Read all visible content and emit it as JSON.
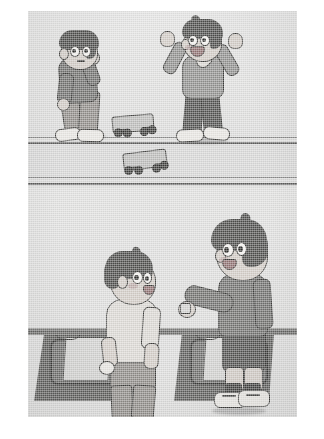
{
  "meta": {
    "kind": "scanned-illustration",
    "orientation": "portrait",
    "color_mode": "grayscale",
    "panel_count": 2
  },
  "palette": {
    "page_background": "#ffffff",
    "illustration_background": "#dcdcdb",
    "ink_outline": "#3a3a38",
    "hair_dark": "#4b4b49",
    "skin": "#cfc9c3",
    "shirt_dark_gray": "#6e6e6c",
    "shirt_mid_gray": "#8e8e8c",
    "shirt_light": "#d9d6d1",
    "pants_dark": "#4f4f4d",
    "shoe_white": "#e6e4e0",
    "shoe_dark": "#3f3f3d",
    "road_line": "#5d5d5c",
    "desk_dark": "#5b5b59",
    "paper_light": "#cfcfcd"
  },
  "illustration": {
    "frame": {
      "left": 28,
      "top": 11,
      "width": 269,
      "height": 406
    },
    "panels": [
      {
        "id": "panel-top",
        "name": "top-panel",
        "setting": "sidewalk-and-road",
        "description": "Two boys on a pavement beside a road with two loose skateboards on the ground.",
        "road": {
          "lines": [
            {
              "y": 126,
              "thickness": 1,
              "tone": "#8b8b8a"
            },
            {
              "y": 131,
              "thickness": 2,
              "tone": "#5d5d5c"
            },
            {
              "y": 166,
              "thickness": 1,
              "tone": "#8b8b8a"
            },
            {
              "y": 172,
              "thickness": 2,
              "tone": "#5d5d5c"
            }
          ]
        },
        "characters": [
          {
            "id": "boy-sad",
            "name": "bending-boy-left",
            "pose": "bent forward, hands on knees, downcast",
            "expression": "sad",
            "hair": "dark short",
            "top": "dark gray long-sleeve jacket",
            "bottom": "gray trousers",
            "shoes": "white sneakers"
          },
          {
            "id": "boy-cheering",
            "name": "cheering-boy-right",
            "pose": "both arms raised, mouth open, jumping",
            "expression": "happy / cheering",
            "hair": "dark short",
            "top": "mid gray sweater with collar",
            "bottom": "dark trousers",
            "shoes": "white sneakers"
          }
        ],
        "objects": [
          {
            "id": "skateboard-1",
            "name": "skateboard-on-pavement",
            "tone": "#b9b9b7",
            "wheels": 4
          },
          {
            "id": "skateboard-2",
            "name": "skateboard-on-road",
            "tone": "#b9b9b7",
            "wheels": 4
          }
        ]
      },
      {
        "id": "panel-bottom",
        "name": "bottom-panel",
        "setting": "indoor counter or desks",
        "description": "A shirtless-sleeved boy in a light tee faces a taller boy in a dark outfit who reaches across a counter holding something; two dark desks with light papers sit behind them.",
        "characters": [
          {
            "id": "boy-light-shirt",
            "name": "boy-in-light-shirt",
            "pose": "standing, back three-quarter view, looking up and right",
            "expression": "smiling",
            "hair": "dark bowl cut",
            "top": "light cream short-sleeve shirt",
            "bottom": "gray shorts",
            "shoes": "not visible"
          },
          {
            "id": "boy-dark-outfit",
            "name": "boy-in-dark-outfit",
            "pose": "standing, reaching left arm forward over the counter",
            "expression": "smiling",
            "hair": "dark spiky-top cut",
            "top": "dark gray long-sleeve shirt",
            "bottom": "dark shorts",
            "shoes": "white sneakers with dark socks"
          }
        ],
        "objects": [
          {
            "id": "counter-bar",
            "name": "counter-edge",
            "tone": "#5e5e5c"
          },
          {
            "id": "desk-left",
            "name": "desk-left",
            "tone": "#5b5b59"
          },
          {
            "id": "desk-right",
            "name": "desk-right",
            "tone": "#5b5b59"
          },
          {
            "id": "paper-left",
            "name": "paper-on-left-desk",
            "tone": "#cfcfcd"
          },
          {
            "id": "paper-right",
            "name": "paper-on-right-desk",
            "tone": "#cfcfcd"
          }
        ]
      }
    ]
  },
  "caption": {
    "text": ""
  }
}
